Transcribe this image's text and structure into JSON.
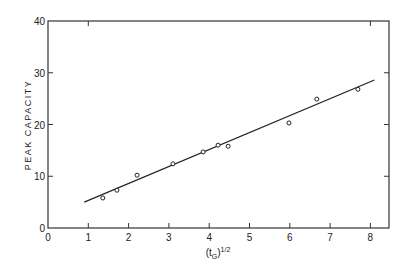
{
  "chart_data": {
    "type": "scatter",
    "title": "",
    "xlabel": "(t_G)^1/2",
    "xlabel_parts": {
      "open": "(t",
      "sub": "G",
      "close": ")",
      "sup": "1/2"
    },
    "ylabel": "PEAK CAPACITY",
    "xlim": [
      0,
      8.5
    ],
    "ylim": [
      0,
      40
    ],
    "x_ticks": [
      "0",
      "1",
      "2",
      "3",
      "4",
      "5",
      "6",
      "7",
      "8"
    ],
    "y_ticks": [
      "0",
      "10",
      "20",
      "30",
      "40"
    ],
    "grid": false,
    "legend": null,
    "series": [
      {
        "name": "measured",
        "marker": "open-circle",
        "points": [
          {
            "x": 1.36,
            "y": 5.8
          },
          {
            "x": 1.71,
            "y": 7.3
          },
          {
            "x": 2.21,
            "y": 10.2
          },
          {
            "x": 3.1,
            "y": 12.4
          },
          {
            "x": 3.85,
            "y": 14.7
          },
          {
            "x": 4.22,
            "y": 16.0
          },
          {
            "x": 4.47,
            "y": 15.8
          },
          {
            "x": 5.98,
            "y": 20.3
          },
          {
            "x": 6.67,
            "y": 24.9
          },
          {
            "x": 7.69,
            "y": 26.8
          }
        ]
      },
      {
        "name": "fit",
        "type": "line",
        "points": [
          {
            "x": 0.9,
            "y": 5.0
          },
          {
            "x": 8.1,
            "y": 28.6
          }
        ]
      }
    ]
  }
}
